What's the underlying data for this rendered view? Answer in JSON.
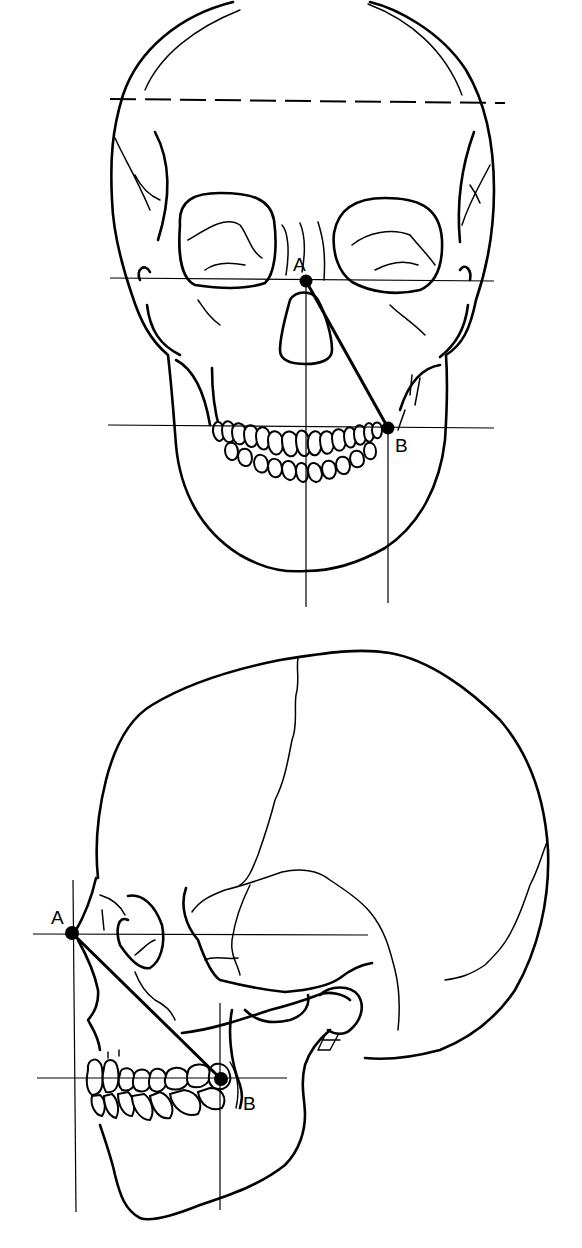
{
  "figure": {
    "frontal_view": {
      "point_a_label": "A",
      "point_b_label": "B",
      "point_a": [
        306,
        281
      ],
      "point_b": [
        388,
        428
      ],
      "reference_lines": {
        "dashed_horizontal_y": 100,
        "horizontal_a_y": 279,
        "horizontal_b_y": 427,
        "vertical_midline_x": 306,
        "vertical_b_x": 388
      }
    },
    "lateral_view": {
      "point_a_label": "A",
      "point_b_label": "B",
      "point_a": [
        72,
        933
      ],
      "point_b": [
        221,
        1079
      ],
      "reference_lines": {
        "horizontal_a_y": 934,
        "horizontal_b_y": 1078,
        "vertical_a_x": 73,
        "vertical_b_x": 220
      }
    },
    "colors": {
      "ink": "#000000",
      "paper": "#ffffff"
    }
  }
}
